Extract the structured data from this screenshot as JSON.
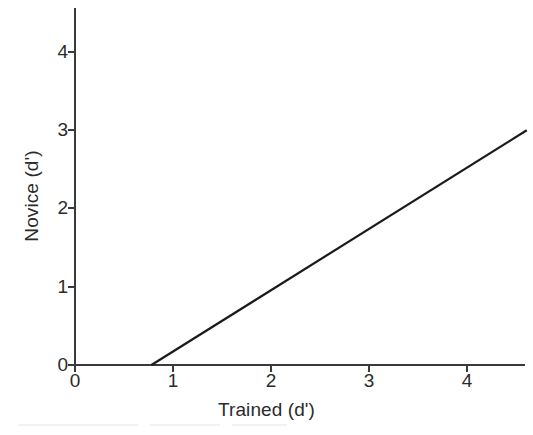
{
  "chart_data": {
    "type": "line",
    "title": "",
    "subtitle": "",
    "xlabel": "Trained (d')",
    "ylabel": "Novice (d')",
    "xlim": [
      0,
      4.6
    ],
    "ylim": [
      0,
      4.55
    ],
    "xticks": [
      0,
      1,
      2,
      3,
      4
    ],
    "yticks": [
      0,
      1,
      2,
      3,
      4
    ],
    "xticklabels": [
      "0",
      "1",
      "2",
      "3",
      "4"
    ],
    "yticklabels": [
      "0",
      "1",
      "2",
      "3",
      "4"
    ],
    "grid": false,
    "legend": null,
    "annotations": [],
    "series": [
      {
        "name": "fit line",
        "type": "line",
        "color": "#1a1a1a",
        "linewidth": 2,
        "x": [
          0.78,
          4.61
        ],
        "y": [
          0.0,
          3.0
        ],
        "slope": 0.783,
        "intercept": -0.611,
        "x_intercept": 0.78
      }
    ]
  },
  "axes": {
    "x_axis_name": "x-axis",
    "y_axis_name": "y-axis",
    "tick_direction": "out",
    "spine_color": "#3a3a3a"
  },
  "labels": {
    "x": "Trained (d')",
    "y": "Novice (d')"
  },
  "ticks": {
    "x": [
      "0",
      "1",
      "2",
      "3",
      "4"
    ],
    "y": [
      "0",
      "1",
      "2",
      "3",
      "4"
    ]
  },
  "colors": {
    "line": "#1a1a1a",
    "axis": "#3a3a3a",
    "text": "#2b2b2b",
    "background": "#ffffff"
  }
}
